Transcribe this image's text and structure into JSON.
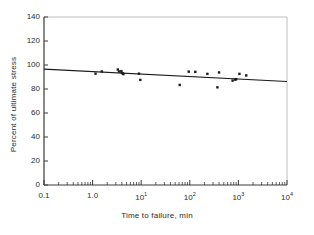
{
  "figure": {
    "background": "#ffffff",
    "frame_color": "#bdbdbd",
    "axis_color": "#3a3a3a",
    "marker_color": "#1a1a1a",
    "line_color": "#1a1a1a"
  },
  "chart_data": {
    "type": "scatter",
    "title": "",
    "subtitle": "",
    "xlabel": "Time to failure, min",
    "ylabel": "Percent of ultimate stress",
    "xscale": "log",
    "yscale": "linear",
    "xlim": [
      0.1,
      10000
    ],
    "ylim": [
      0,
      140
    ],
    "grid": false,
    "legend": null,
    "xticks": [
      0.1,
      1.0,
      10,
      100,
      1000,
      10000
    ],
    "xtick_labels": [
      "0.1",
      "1.0",
      "10",
      "10",
      "10",
      "10"
    ],
    "xtick_label_display": [
      "0I",
      "1.0",
      "10¹",
      "10²",
      "10³",
      "10⁴"
    ],
    "xtick_mantissa": [
      "0.1",
      "1.0",
      "10",
      "10",
      "10",
      "10"
    ],
    "xtick_exponent": [
      "",
      "",
      "1",
      "2",
      "3",
      "4"
    ],
    "xminor_ticks": true,
    "yticks": [
      0,
      20,
      40,
      60,
      80,
      100,
      120,
      140
    ],
    "ytick_labels": [
      "0",
      "20",
      "40",
      "60",
      "80",
      "100",
      "120",
      "140"
    ],
    "series": [
      {
        "name": "Observed specimens",
        "type": "scatter",
        "marker": "square",
        "marker_size_px": 2.4,
        "color": "#1a1a1a",
        "points": [
          {
            "x": 1.15,
            "y": 92.8
          },
          {
            "x": 1.55,
            "y": 94.6
          },
          {
            "x": 3.3,
            "y": 96.2
          },
          {
            "x": 3.5,
            "y": 94.6
          },
          {
            "x": 3.9,
            "y": 94.9
          },
          {
            "x": 4.0,
            "y": 93.4
          },
          {
            "x": 4.2,
            "y": 93.0
          },
          {
            "x": 4.3,
            "y": 92.4
          },
          {
            "x": 9.0,
            "y": 92.8
          },
          {
            "x": 9.6,
            "y": 87.6
          },
          {
            "x": 62.0,
            "y": 83.4
          },
          {
            "x": 95.0,
            "y": 94.5
          },
          {
            "x": 130.0,
            "y": 94.3
          },
          {
            "x": 230.0,
            "y": 92.6
          },
          {
            "x": 370.0,
            "y": 81.4
          },
          {
            "x": 400.0,
            "y": 93.8
          },
          {
            "x": 760.0,
            "y": 87.0
          },
          {
            "x": 860.0,
            "y": 87.8
          },
          {
            "x": 900.0,
            "y": 88.2
          },
          {
            "x": 1050.0,
            "y": 92.6
          },
          {
            "x": 1450.0,
            "y": 91.3
          }
        ]
      },
      {
        "name": "Fitted regression line",
        "type": "line",
        "color": "#1a1a1a",
        "width_px": 1.1,
        "endpoints": [
          {
            "x": 0.1,
            "y": 96.6
          },
          {
            "x": 10000,
            "y": 86.2
          }
        ]
      }
    ]
  }
}
